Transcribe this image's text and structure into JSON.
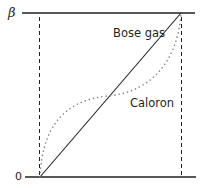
{
  "diagram": {
    "axis": {
      "top_label": "β",
      "bottom_label": "0"
    },
    "curves": [
      {
        "id": "bose-gas",
        "label": "Bose gas",
        "style": "solid",
        "shape": "linear"
      },
      {
        "id": "caloron",
        "label": "Caloron",
        "style": "dotted",
        "shape": "s-curve"
      }
    ],
    "colors": {
      "line": "#231f20",
      "dotted": "#8a8a8a"
    }
  }
}
